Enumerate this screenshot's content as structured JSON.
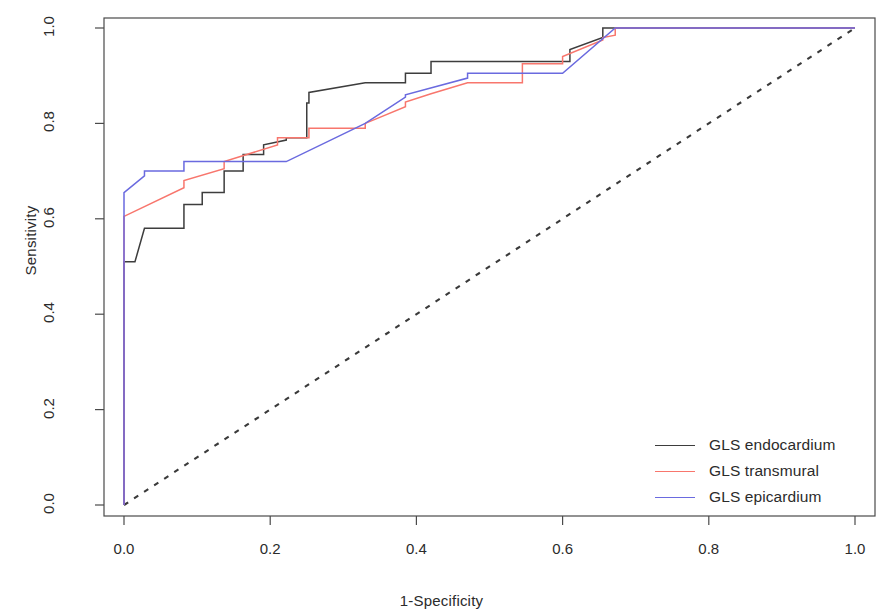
{
  "chart_data": {
    "type": "line",
    "title": "",
    "xlabel": "1-Specificity",
    "ylabel": "Sensitivity",
    "xlim": [
      0.0,
      1.0
    ],
    "ylim": [
      0.0,
      1.0
    ],
    "grid": false,
    "legend_position": "bottom-right",
    "xticks": [
      "0.0",
      "0.2",
      "0.4",
      "0.6",
      "0.8",
      "1.0"
    ],
    "xtick_values": [
      0.0,
      0.2,
      0.4,
      0.6,
      0.8,
      1.0
    ],
    "yticks": [
      "0.0",
      "0.2",
      "0.4",
      "0.6",
      "0.8",
      "1.0"
    ],
    "ytick_values": [
      0.0,
      0.2,
      0.4,
      0.6,
      0.8,
      1.0
    ],
    "reference_line": {
      "name": "chance-diagonal",
      "style": "dashed",
      "color": "#3a3a3a",
      "points": [
        [
          0.0,
          0.0
        ],
        [
          1.0,
          1.0
        ]
      ]
    },
    "series": [
      {
        "name": "GLS endocardium",
        "color": "#3d3d3d",
        "points": [
          [
            0.0,
            0.0
          ],
          [
            0.0,
            0.51
          ],
          [
            0.015,
            0.51
          ],
          [
            0.028,
            0.58
          ],
          [
            0.028,
            0.58
          ],
          [
            0.082,
            0.58
          ],
          [
            0.082,
            0.63
          ],
          [
            0.107,
            0.63
          ],
          [
            0.107,
            0.655
          ],
          [
            0.137,
            0.655
          ],
          [
            0.137,
            0.7
          ],
          [
            0.163,
            0.7
          ],
          [
            0.163,
            0.735
          ],
          [
            0.191,
            0.735
          ],
          [
            0.191,
            0.755
          ],
          [
            0.222,
            0.765
          ],
          [
            0.222,
            0.77
          ],
          [
            0.25,
            0.77
          ],
          [
            0.25,
            0.843
          ],
          [
            0.253,
            0.843
          ],
          [
            0.253,
            0.865
          ],
          [
            0.33,
            0.885
          ],
          [
            0.33,
            0.885
          ],
          [
            0.385,
            0.885
          ],
          [
            0.385,
            0.905
          ],
          [
            0.42,
            0.905
          ],
          [
            0.42,
            0.93
          ],
          [
            0.61,
            0.93
          ],
          [
            0.61,
            0.955
          ],
          [
            0.655,
            0.98
          ],
          [
            0.655,
            1.0
          ],
          [
            1.0,
            1.0
          ]
        ]
      },
      {
        "name": "GLS transmural",
        "color": "#f8766d",
        "points": [
          [
            0.0,
            0.0
          ],
          [
            0.0,
            0.605
          ],
          [
            0.0,
            0.605
          ],
          [
            0.082,
            0.665
          ],
          [
            0.082,
            0.68
          ],
          [
            0.137,
            0.705
          ],
          [
            0.137,
            0.72
          ],
          [
            0.21,
            0.755
          ],
          [
            0.21,
            0.77
          ],
          [
            0.25,
            0.77
          ],
          [
            0.25,
            0.77
          ],
          [
            0.253,
            0.77
          ],
          [
            0.253,
            0.79
          ],
          [
            0.33,
            0.79
          ],
          [
            0.33,
            0.8
          ],
          [
            0.385,
            0.835
          ],
          [
            0.385,
            0.845
          ],
          [
            0.42,
            0.862
          ],
          [
            0.42,
            0.862
          ],
          [
            0.47,
            0.885
          ],
          [
            0.47,
            0.885
          ],
          [
            0.545,
            0.885
          ],
          [
            0.545,
            0.925
          ],
          [
            0.6,
            0.925
          ],
          [
            0.6,
            0.94
          ],
          [
            0.655,
            0.975
          ],
          [
            0.655,
            0.98
          ],
          [
            0.672,
            0.985
          ],
          [
            0.672,
            1.0
          ],
          [
            1.0,
            1.0
          ]
        ]
      },
      {
        "name": "GLS epicardium",
        "color": "#6a6adf",
        "points": [
          [
            0.0,
            0.0
          ],
          [
            0.0,
            0.655
          ],
          [
            0.0,
            0.655
          ],
          [
            0.028,
            0.69
          ],
          [
            0.028,
            0.7
          ],
          [
            0.082,
            0.7
          ],
          [
            0.082,
            0.72
          ],
          [
            0.222,
            0.72
          ],
          [
            0.222,
            0.72
          ],
          [
            0.33,
            0.8
          ],
          [
            0.33,
            0.8
          ],
          [
            0.385,
            0.855
          ],
          [
            0.385,
            0.86
          ],
          [
            0.47,
            0.895
          ],
          [
            0.47,
            0.905
          ],
          [
            0.6,
            0.905
          ],
          [
            0.6,
            0.905
          ],
          [
            0.672,
            1.0
          ],
          [
            0.672,
            1.0
          ],
          [
            1.0,
            1.0
          ]
        ]
      }
    ]
  },
  "legend": {
    "items": [
      {
        "label": "GLS endocardium",
        "color": "#3d3d3d"
      },
      {
        "label": "GLS transmural",
        "color": "#f8766d"
      },
      {
        "label": "GLS epicardium",
        "color": "#6a6adf"
      }
    ]
  },
  "axes": {
    "x_title": "1-Specificity",
    "y_title": "Sensitivity"
  }
}
